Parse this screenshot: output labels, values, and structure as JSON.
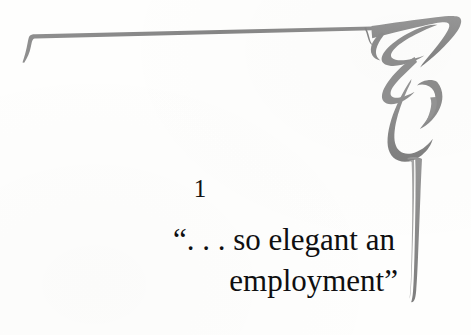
{
  "page": {
    "kind": "book-chapter-opening-page",
    "background_color": "#fefefd",
    "ink_color": "#0f0f10"
  },
  "ornament": {
    "name": "art-nouveau-corner-flourish",
    "color": "#8a8a8a",
    "color_light": "#9c9c9c",
    "description": "Thin horizontal rule along the top with a tapered tail at the left end, meeting a curling ribbon scroll at the top right that descends into a long tapering vertical stem down the right margin."
  },
  "chapter": {
    "number": "1",
    "title_line_1": "“. . . so elegant an",
    "title_line_2": "employment”",
    "title_full": "“. . . so elegant an employment”"
  }
}
